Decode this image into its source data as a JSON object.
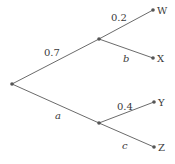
{
  "diagram": {
    "type": "probability-tree",
    "nodes": {
      "root": {
        "x": 12,
        "y": 84
      },
      "upper": {
        "x": 99,
        "y": 39
      },
      "lower": {
        "x": 99,
        "y": 123
      },
      "W": {
        "x": 153,
        "y": 10,
        "label": "W"
      },
      "X": {
        "x": 153,
        "y": 58,
        "label": "X"
      },
      "Y": {
        "x": 154,
        "y": 102,
        "label": "Y"
      },
      "Z": {
        "x": 154,
        "y": 147,
        "label": "Z"
      }
    },
    "edges": [
      {
        "from": "root",
        "to": "upper",
        "label": "0.7",
        "italic": false
      },
      {
        "from": "root",
        "to": "lower",
        "label": "a",
        "italic": true
      },
      {
        "from": "upper",
        "to": "W",
        "label": "0.2",
        "italic": false
      },
      {
        "from": "upper",
        "to": "X",
        "label": "b",
        "italic": true
      },
      {
        "from": "lower",
        "to": "Y",
        "label": "0.4",
        "italic": false
      },
      {
        "from": "lower",
        "to": "Z",
        "label": "c",
        "italic": true
      }
    ]
  },
  "labels": {
    "edge_root_upper": "0.7",
    "edge_root_lower": "a",
    "edge_upper_w": "0.2",
    "edge_upper_x": "b",
    "edge_lower_y": "0.4",
    "edge_lower_z": "c",
    "leaf_w": "W",
    "leaf_x": "X",
    "leaf_y": "Y",
    "leaf_z": "Z"
  },
  "colors": {
    "line": "#6b6b6b",
    "node": "#555555",
    "text": "#3a3a3a",
    "background": "#ffffff"
  }
}
